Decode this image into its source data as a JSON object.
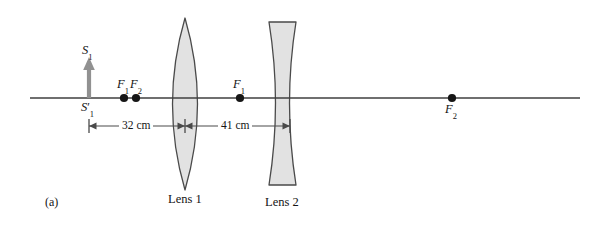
{
  "figure": {
    "panel_label": "(a)",
    "background_color": "#ffffff",
    "width": 605,
    "height": 227
  },
  "axis": {
    "name": "optical-axis",
    "color": "#3f3f3f",
    "x_start": 30,
    "x_end": 580,
    "y": 98
  },
  "object": {
    "label_top": "S",
    "label_top_sub": "1",
    "label_bottom": "S",
    "label_bottom_sub": "1",
    "label_bottom_prime": "′",
    "color": "#8c8c8c",
    "x": 89,
    "y_base": 98,
    "y_tip": 60
  },
  "points": [
    {
      "name": "focal-point-f1-left",
      "label": "F",
      "sub": "1",
      "x": 124,
      "y": 98,
      "label_position": "above"
    },
    {
      "name": "focal-point-f2-left",
      "label": "F",
      "sub": "2",
      "x": 136,
      "y": 98,
      "label_position": "above"
    },
    {
      "name": "focal-point-f1-mid",
      "label": "F",
      "sub": "1",
      "x": 240,
      "y": 98,
      "label_position": "above"
    },
    {
      "name": "focal-point-f2-right",
      "label": "F",
      "sub": "2",
      "x": 452,
      "y": 98,
      "label_position": "below"
    }
  ],
  "lenses": [
    {
      "name": "lens-1",
      "label": "Lens 1",
      "type": "biconvex",
      "fill": "#e0e0e0",
      "stroke": "#4a4a4a",
      "x_left": 160,
      "x_right": 210,
      "x_center": 185,
      "y_top": 18,
      "y_bottom": 190,
      "label_x": 172,
      "label_y": 196
    },
    {
      "name": "lens-2",
      "label": "Lens 2",
      "type": "biconcave",
      "fill": "#e0e0e0",
      "stroke": "#4a4a4a",
      "x_left": 269,
      "x_right": 296,
      "x_center": 282,
      "y_top": 22,
      "y_bottom": 185,
      "label_x": 268,
      "label_y": 199
    }
  ],
  "dimensions": [
    {
      "name": "dimension-32cm",
      "value": "32 cm",
      "x_start": 89,
      "x_end": 185,
      "y": 126
    },
    {
      "name": "dimension-41cm",
      "value": "41 cm",
      "x_start": 185,
      "x_end": 290,
      "y": 126
    }
  ]
}
